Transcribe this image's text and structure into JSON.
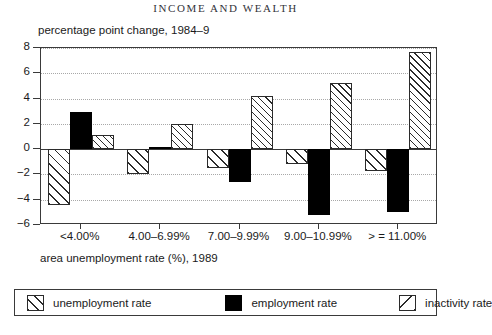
{
  "page": {
    "running_head": "INCOME AND WEALTH"
  },
  "chart_data": {
    "type": "bar",
    "title": "",
    "ylabel": "percentage point change, 1984–9",
    "xlabel": "area unemployment rate (%), 1989",
    "ylim": [
      -6,
      8
    ],
    "yticks": [
      8,
      6,
      4,
      2,
      0,
      -2,
      -4,
      -6
    ],
    "ytick_labels": [
      "8",
      "6",
      "4",
      "2",
      "0",
      "−2",
      "−4",
      "−6"
    ],
    "grid": true,
    "grid_axis": "y",
    "legend_position": "below",
    "categories": [
      "<4.00%",
      "4.00–6.99%",
      "7.00–9.99%",
      "9.00–10.99%",
      "> = 11.00%"
    ],
    "series": [
      {
        "name": "unemployment rate",
        "pattern": "forward-diagonal-hatch",
        "color": "#ffffff",
        "edge_color": "#2b2b2b",
        "values": [
          -4.4,
          -2.0,
          -1.5,
          -1.2,
          -1.7
        ]
      },
      {
        "name": "employment rate",
        "pattern": "solid",
        "color": "#000000",
        "edge_color": "#000000",
        "values": [
          2.9,
          0.2,
          -2.6,
          -5.2,
          -5.0
        ]
      },
      {
        "name": "inactivity rate",
        "pattern": "dense-diagonal-hatch",
        "color": "#ffffff",
        "edge_color": "#2b2b2b",
        "values": [
          1.1,
          2.0,
          4.2,
          5.2,
          7.7
        ]
      }
    ]
  },
  "legend": {
    "items": [
      {
        "label": "unemployment rate"
      },
      {
        "label": "employment rate"
      },
      {
        "label": "inactivity rate"
      }
    ]
  }
}
